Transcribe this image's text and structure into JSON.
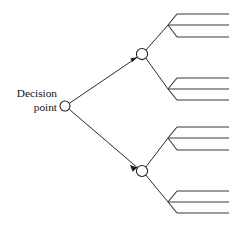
{
  "diagram": {
    "canvas": {
      "width": 234,
      "height": 226,
      "background": "#ffffff"
    },
    "colors": {
      "line": "#2b2b2b",
      "outcome_line": "#3a3a3a",
      "node_stroke": "#1f1f1f",
      "node_fill": "#ffffff",
      "text": "#111111"
    },
    "labels": {
      "decision_line1": "Decision",
      "decision_line2": "point"
    },
    "nodes": [
      {
        "id": "decision-point",
        "cx": 65,
        "cy": 106,
        "r": 5.0
      },
      {
        "id": "upper-chance-node",
        "cx": 142,
        "cy": 54,
        "r": 5.6
      },
      {
        "id": "lower-chance-node",
        "cx": 142,
        "cy": 171,
        "r": 5.6
      }
    ],
    "branches": [
      {
        "id": "upper-branch",
        "from": "decision-point",
        "to": "upper-chance-node",
        "arrow": true
      },
      {
        "id": "lower-branch",
        "from": "decision-point",
        "to": "lower-chance-node",
        "arrow": true
      }
    ],
    "fans": [
      {
        "id": "fan-upper-a",
        "from_node": "upper-chance-node",
        "junction": {
          "x": 168,
          "y": 25
        },
        "outcomes": [
          {
            "y": 14,
            "x_start": 177,
            "x_end": 229
          },
          {
            "y": 25,
            "x_start": 172,
            "x_end": 229
          },
          {
            "y": 37,
            "x_start": 177,
            "x_end": 229
          }
        ]
      },
      {
        "id": "fan-upper-b",
        "from_node": "upper-chance-node",
        "junction": {
          "x": 168,
          "y": 89
        },
        "outcomes": [
          {
            "y": 78,
            "x_start": 177,
            "x_end": 229
          },
          {
            "y": 89,
            "x_start": 172,
            "x_end": 229
          },
          {
            "y": 100,
            "x_start": 177,
            "x_end": 229
          }
        ]
      },
      {
        "id": "fan-lower-a",
        "from_node": "lower-chance-node",
        "junction": {
          "x": 168,
          "y": 138
        },
        "outcomes": [
          {
            "y": 127,
            "x_start": 177,
            "x_end": 229
          },
          {
            "y": 138,
            "x_start": 172,
            "x_end": 229
          },
          {
            "y": 150,
            "x_start": 177,
            "x_end": 229
          }
        ]
      },
      {
        "id": "fan-lower-b",
        "from_node": "lower-chance-node",
        "junction": {
          "x": 168,
          "y": 202
        },
        "outcomes": [
          {
            "y": 191,
            "x_start": 177,
            "x_end": 229
          },
          {
            "y": 202,
            "x_start": 172,
            "x_end": 229
          },
          {
            "y": 213,
            "x_start": 177,
            "x_end": 229
          }
        ]
      }
    ]
  }
}
